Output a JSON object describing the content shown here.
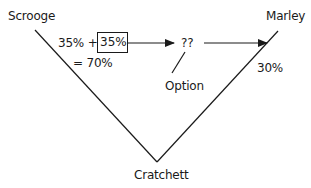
{
  "diagram": {
    "nodes": {
      "scrooge": "Scrooge",
      "marley": "Marley",
      "cratchett": "Cratchett",
      "unknown": "??",
      "option": "Option"
    },
    "labels": {
      "scrooge_share_prefix": "35% +",
      "scrooge_share_boxed": "35%",
      "scrooge_total": "= 70%",
      "marley_share": "30%"
    },
    "edges": [
      {
        "from": "Scrooge",
        "to": "Cratchett",
        "type": "line"
      },
      {
        "from": "Marley",
        "to": "Cratchett",
        "type": "line"
      },
      {
        "from": "35% (boxed)",
        "to": "??",
        "type": "arrow"
      },
      {
        "from": "??",
        "to": "Marley",
        "type": "arrow"
      },
      {
        "from": "Option",
        "to": "??",
        "type": "line"
      }
    ],
    "colors": {
      "stroke": "#1a1a1a",
      "background": "#ffffff"
    }
  }
}
